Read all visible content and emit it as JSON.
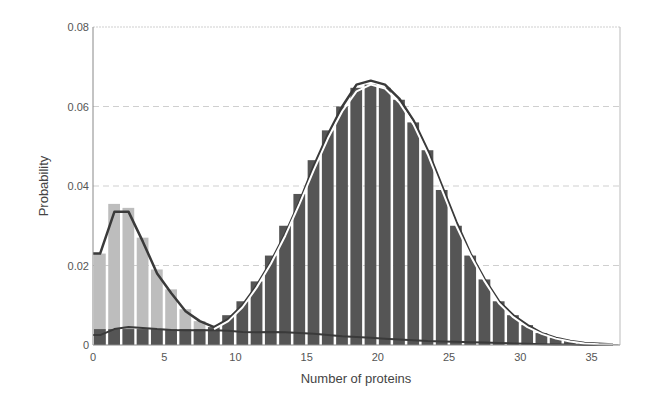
{
  "chart_data": {
    "type": "bar",
    "title": "",
    "xlabel": "Number of proteins",
    "ylabel": "Probability",
    "xlim": [
      0,
      37
    ],
    "ylim": [
      0,
      0.08
    ],
    "xticks": [
      0,
      5,
      10,
      15,
      20,
      25,
      30,
      35
    ],
    "xtick_labels": [
      "0",
      "5",
      "10",
      "15",
      "20",
      "25",
      "30",
      "35"
    ],
    "yticks": [
      0,
      0.02,
      0.04,
      0.06,
      0.08
    ],
    "ytick_labels": [
      "0",
      "0.02",
      "0.04",
      "0.06",
      "0.08"
    ],
    "grid": "horizontal dashed",
    "legend": null,
    "x": [
      0,
      1,
      2,
      3,
      4,
      5,
      6,
      7,
      8,
      9,
      10,
      11,
      12,
      13,
      14,
      15,
      16,
      17,
      18,
      19,
      20,
      21,
      22,
      23,
      24,
      25,
      26,
      27,
      28,
      29,
      30,
      31,
      32,
      33,
      34,
      35,
      36
    ],
    "series": [
      {
        "name": "low-state histogram",
        "style": "light gray bars",
        "color": "#bdbdbd",
        "values": [
          0.023,
          0.0355,
          0.0345,
          0.027,
          0.019,
          0.014,
          0.009,
          0.006,
          0.004,
          0,
          0,
          0,
          0,
          0,
          0,
          0,
          0,
          0,
          0,
          0,
          0,
          0,
          0,
          0,
          0,
          0,
          0,
          0,
          0,
          0,
          0,
          0,
          0,
          0,
          0,
          0,
          0
        ]
      },
      {
        "name": "high-state histogram",
        "style": "dark gray bars",
        "color": "#555555",
        "values": [
          0.004,
          0.004,
          0.004,
          0.004,
          0.004,
          0.004,
          0.004,
          0.004,
          0.0045,
          0.0075,
          0.011,
          0.016,
          0.0225,
          0.03,
          0.038,
          0.0465,
          0.054,
          0.06,
          0.0647,
          0.0655,
          0.0647,
          0.0617,
          0.056,
          0.049,
          0.039,
          0.03,
          0.0225,
          0.0165,
          0.011,
          0.0075,
          0.005,
          0.003,
          0.0018,
          0.001,
          0.0005,
          0.0003,
          0.0001
        ]
      },
      {
        "name": "total distribution curve",
        "style": "dark line",
        "color": "#3a3a3a",
        "values": [
          0.023,
          0.0335,
          0.0335,
          0.026,
          0.018,
          0.013,
          0.0085,
          0.006,
          0.0045,
          0.0065,
          0.01,
          0.015,
          0.021,
          0.028,
          0.036,
          0.045,
          0.053,
          0.06,
          0.0655,
          0.0665,
          0.0655,
          0.062,
          0.0565,
          0.049,
          0.04,
          0.031,
          0.023,
          0.0165,
          0.011,
          0.0075,
          0.005,
          0.003,
          0.0018,
          0.001,
          0.0005,
          0.0003,
          0.0001
        ]
      },
      {
        "name": "high-state fit curve",
        "style": "white line",
        "color": "#ffffff",
        "values": [
          null,
          null,
          null,
          null,
          null,
          null,
          null,
          null,
          0.004,
          0.006,
          0.0095,
          0.0145,
          0.0205,
          0.0275,
          0.0355,
          0.044,
          0.052,
          0.0588,
          0.0638,
          0.0655,
          0.0645,
          0.061,
          0.0555,
          0.048,
          0.039,
          0.03,
          0.0225,
          0.016,
          0.0105,
          0.007,
          0.0045,
          0.0028,
          0.0016,
          0.0009,
          0.0004,
          0.0002,
          0.0001
        ]
      },
      {
        "name": "low-state background curve",
        "style": "dark line",
        "color": "#3a3a3a",
        "values": [
          0.0025,
          0.004,
          0.0045,
          0.0043,
          0.004,
          0.0038,
          0.0037,
          0.0037,
          0.0037,
          0.0036,
          0.0033,
          0.0032,
          0.0033,
          0.0032,
          0.003,
          0.0028,
          0.0025,
          0.0022,
          0.002,
          0.0018,
          0.0016,
          0.0014,
          0.0012,
          0.001,
          0.0009,
          0.0008,
          0.0007,
          0.0006,
          0.0005,
          0.0004,
          0.0003,
          0.0002,
          0.0001,
          0.0001,
          0,
          0,
          0
        ]
      }
    ]
  },
  "labels": {
    "xlabel": "Number of proteins",
    "ylabel": "Probability"
  }
}
